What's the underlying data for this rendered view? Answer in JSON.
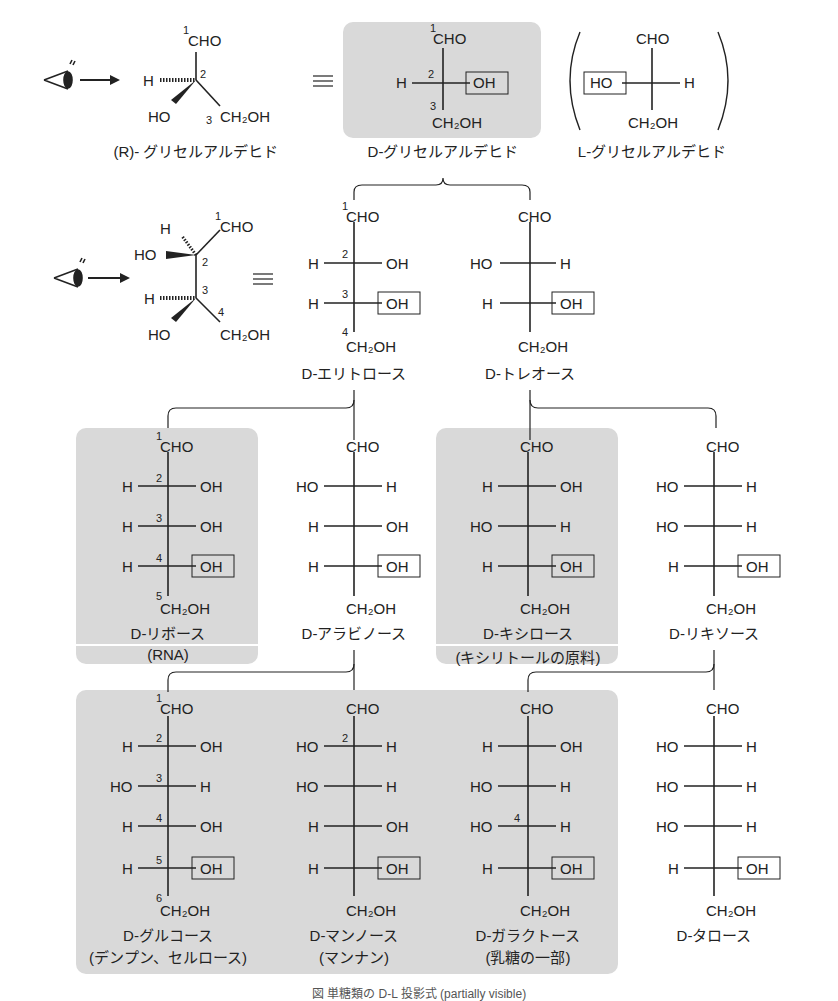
{
  "figure": {
    "caption": "図 単糖類の D-L 投影式 (partially visible)",
    "shaded_color": "#d9d9d9",
    "line_color": "#222222"
  },
  "row0": {
    "wedge_label": "(R)- グリセルアルデヒド",
    "d_label": "D-グリセルアルデヒド",
    "l_label": "L-グリセルアルデヒド",
    "equiv": "≡",
    "paren_open": "(",
    "paren_close": ")"
  },
  "row1": {
    "equiv": "≡",
    "erythrose": "D-エリトロース",
    "threose": "D-トレオース"
  },
  "row2": {
    "ribose": "D-リボース",
    "ribose_note": "(RNA)",
    "arabinose": "D-アラビノース",
    "xylose": "D-キシロース",
    "xylose_note": "(キシリトールの原料)",
    "lyxose": "D-リキソース"
  },
  "row3": {
    "glucose": "D-グルコース",
    "glucose_note": "(デンプン、セルロース)",
    "mannose": "D-マンノース",
    "mannose_note": "(マンナン)",
    "galactose": "D-ガラクトース",
    "galactose_note": "(乳糖の一部)",
    "talose": "D-タロース"
  },
  "groups": {
    "cho": "CHO",
    "ch2oh": "CH₂OH",
    "h": "H",
    "oh": "OH",
    "ho": "HO"
  },
  "structures": [
    {
      "name": "D-glyceraldehyde",
      "rows": [
        [
          "H",
          "OH"
        ]
      ]
    },
    {
      "name": "L-glyceraldehyde",
      "rows": [
        [
          "HO",
          "H"
        ]
      ]
    },
    {
      "name": "D-erythrose",
      "rows": [
        [
          "H",
          "OH"
        ],
        [
          "H",
          "OH"
        ]
      ]
    },
    {
      "name": "D-threose",
      "rows": [
        [
          "HO",
          "H"
        ],
        [
          "H",
          "OH"
        ]
      ]
    },
    {
      "name": "D-ribose",
      "rows": [
        [
          "H",
          "OH"
        ],
        [
          "H",
          "OH"
        ],
        [
          "H",
          "OH"
        ]
      ]
    },
    {
      "name": "D-arabinose",
      "rows": [
        [
          "HO",
          "H"
        ],
        [
          "H",
          "OH"
        ],
        [
          "H",
          "OH"
        ]
      ]
    },
    {
      "name": "D-xylose",
      "rows": [
        [
          "H",
          "OH"
        ],
        [
          "HO",
          "H"
        ],
        [
          "H",
          "OH"
        ]
      ]
    },
    {
      "name": "D-lyxose",
      "rows": [
        [
          "HO",
          "H"
        ],
        [
          "HO",
          "H"
        ],
        [
          "H",
          "OH"
        ]
      ]
    },
    {
      "name": "D-glucose",
      "rows": [
        [
          "H",
          "OH"
        ],
        [
          "HO",
          "H"
        ],
        [
          "H",
          "OH"
        ],
        [
          "H",
          "OH"
        ]
      ]
    },
    {
      "name": "D-mannose",
      "rows": [
        [
          "HO",
          "H"
        ],
        [
          "HO",
          "H"
        ],
        [
          "H",
          "OH"
        ],
        [
          "H",
          "OH"
        ]
      ]
    },
    {
      "name": "D-galactose",
      "rows": [
        [
          "H",
          "OH"
        ],
        [
          "HO",
          "H"
        ],
        [
          "HO",
          "H"
        ],
        [
          "H",
          "OH"
        ]
      ]
    },
    {
      "name": "D-talose",
      "rows": [
        [
          "HO",
          "H"
        ],
        [
          "HO",
          "H"
        ],
        [
          "HO",
          "H"
        ],
        [
          "H",
          "OH"
        ]
      ]
    }
  ]
}
